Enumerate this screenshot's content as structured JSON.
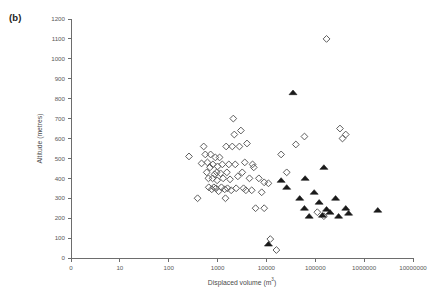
{
  "panel": {
    "label": "(b)"
  },
  "chart_data": {
    "type": "scatter",
    "title": "",
    "xlabel": "Displaced volume (m3)",
    "xlabel_base": "Displaced volume (m",
    "xlabel_sup": "3",
    "xlabel_tail": ")",
    "ylabel": "Altitude (metres)",
    "xscale": "log-with-zero-origin",
    "xticks": [
      0,
      10,
      100,
      1000,
      10000,
      100000,
      1000000,
      10000000
    ],
    "xtick_labels": [
      "0",
      "10",
      "100",
      "1000",
      "10000",
      "100000",
      "1000000",
      "10000000"
    ],
    "yticks": [
      0,
      100,
      200,
      300,
      400,
      500,
      600,
      700,
      800,
      900,
      1000,
      1100,
      1200
    ],
    "ytick_labels": [
      "0",
      "100",
      "200",
      "300",
      "400",
      "500",
      "600",
      "700",
      "800",
      "900",
      "1000",
      "1100",
      "1200"
    ],
    "ylim": [
      0,
      1200
    ],
    "grid": false,
    "legend": null,
    "series": [
      {
        "name": "open-diamond",
        "marker": "diamond",
        "filled": false,
        "color": "#5d5d5d",
        "points": [
          [
            260,
            510
          ],
          [
            390,
            300
          ],
          [
            470,
            475
          ],
          [
            520,
            560
          ],
          [
            560,
            520
          ],
          [
            600,
            430
          ],
          [
            620,
            480
          ],
          [
            650,
            400
          ],
          [
            660,
            355
          ],
          [
            700,
            455
          ],
          [
            720,
            520
          ],
          [
            760,
            345
          ],
          [
            790,
            400
          ],
          [
            800,
            470
          ],
          [
            840,
            355
          ],
          [
            870,
            420
          ],
          [
            900,
            505
          ],
          [
            930,
            350
          ],
          [
            960,
            430
          ],
          [
            980,
            390
          ],
          [
            1000,
            460
          ],
          [
            1050,
            335
          ],
          [
            1100,
            505
          ],
          [
            1150,
            425
          ],
          [
            1200,
            355
          ],
          [
            1250,
            470
          ],
          [
            1300,
            400
          ],
          [
            1400,
            345
          ],
          [
            1500,
            560
          ],
          [
            1550,
            430
          ],
          [
            1600,
            350
          ],
          [
            1700,
            470
          ],
          [
            1800,
            395
          ],
          [
            1900,
            340
          ],
          [
            2000,
            560
          ],
          [
            2100,
            700
          ],
          [
            2200,
            620
          ],
          [
            2300,
            470
          ],
          [
            2400,
            350
          ],
          [
            2600,
            410
          ],
          [
            2800,
            560
          ],
          [
            3000,
            640
          ],
          [
            3200,
            430
          ],
          [
            3400,
            350
          ],
          [
            3600,
            480
          ],
          [
            4000,
            575
          ],
          [
            4500,
            400
          ],
          [
            5000,
            340
          ],
          [
            5500,
            455
          ],
          [
            6000,
            250
          ],
          [
            7000,
            400
          ],
          [
            8000,
            330
          ],
          [
            9000,
            380
          ],
          [
            12000,
            95
          ],
          [
            16000,
            40
          ],
          [
            20000,
            520
          ],
          [
            26000,
            430
          ],
          [
            40000,
            570
          ],
          [
            60000,
            610
          ],
          [
            110000,
            230
          ],
          [
            150000,
            210
          ],
          [
            170000,
            1100
          ],
          [
            320000,
            650
          ],
          [
            360000,
            600
          ],
          [
            420000,
            620
          ],
          [
            9000,
            250
          ],
          [
            11000,
            375
          ],
          [
            1450,
            300
          ],
          [
            3800,
            340
          ],
          [
            5200,
            470
          ]
        ]
      },
      {
        "name": "filled-triangle",
        "marker": "triangle",
        "filled": true,
        "color": "#1a1a1a",
        "points": [
          [
            11000,
            70
          ],
          [
            20000,
            390
          ],
          [
            26000,
            355
          ],
          [
            35000,
            830
          ],
          [
            48000,
            300
          ],
          [
            60000,
            250
          ],
          [
            75000,
            210
          ],
          [
            95000,
            330
          ],
          [
            120000,
            280
          ],
          [
            150000,
            455
          ],
          [
            170000,
            245
          ],
          [
            200000,
            230
          ],
          [
            260000,
            300
          ],
          [
            300000,
            210
          ],
          [
            420000,
            250
          ],
          [
            480000,
            225
          ],
          [
            1900000,
            240
          ],
          [
            62000,
            400
          ],
          [
            140000,
            215
          ]
        ]
      }
    ]
  }
}
